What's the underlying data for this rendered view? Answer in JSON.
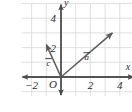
{
  "figure": {
    "background_color": "#ffffff",
    "grid_color": "#d8d8d8",
    "axis_color": "#4a4a4a",
    "vector_color": "#5a5a5a",
    "text_color": "#2b2b2b"
  },
  "chart_data": {
    "type": "scatter",
    "title": "",
    "xlabel": "x",
    "ylabel": "y",
    "xlim": [
      -2.7,
      5.0
    ],
    "ylim": [
      -1.3,
      5.0
    ],
    "grid": true,
    "grid_step": 1,
    "legend": "none",
    "origin_label": "O",
    "xticks": [
      -2,
      2,
      4
    ],
    "xtick_labels": [
      "−2",
      "2",
      "4"
    ],
    "yticks": [
      2,
      4
    ],
    "ytick_labels": [
      "2",
      "4"
    ],
    "vectors": [
      {
        "name": "a",
        "label": "a",
        "label_overbar": true,
        "tail": [
          0,
          0
        ],
        "head": [
          3.5,
          3.0
        ],
        "label_position": [
          1.75,
          1.15
        ]
      },
      {
        "name": "c",
        "label": "c",
        "label_overbar": true,
        "tail": [
          0,
          0
        ],
        "head": [
          -1.0,
          2.2
        ],
        "label_position": [
          -0.85,
          0.75
        ]
      }
    ],
    "annotations": [
      {
        "text": "y",
        "position": [
          0.35,
          4.8
        ],
        "style": "axis-name"
      },
      {
        "text": "x",
        "position": [
          4.55,
          0.45
        ],
        "style": "axis-name"
      },
      {
        "text": "O",
        "position": [
          -0.55,
          -0.75
        ],
        "style": "tick-label"
      }
    ]
  }
}
